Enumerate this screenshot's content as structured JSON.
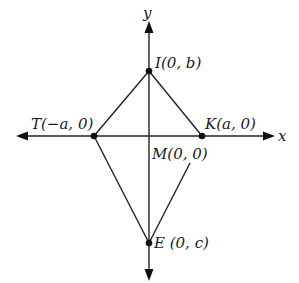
{
  "diagram": {
    "type": "coordinate-geometry",
    "axes": {
      "x_label": "x",
      "y_label": "y"
    },
    "points": [
      {
        "id": "I",
        "name": "I",
        "coords": "(0, b)",
        "label": "I(0, b)",
        "px": [
          149,
          71
        ]
      },
      {
        "id": "T",
        "name": "T",
        "coords": "(−a, 0)",
        "label": "T(−a, 0)",
        "px": [
          94,
          136
        ]
      },
      {
        "id": "K",
        "name": "K",
        "coords": "(a, 0)",
        "label": "K(a, 0)",
        "px": [
          202,
          136
        ]
      },
      {
        "id": "M",
        "name": "M",
        "coords": "(0, 0)",
        "label": "M(0, 0)",
        "px": [
          149,
          136
        ]
      },
      {
        "id": "E",
        "name": "E",
        "coords": "(0, c)",
        "label": "E (0, c)",
        "px": [
          149,
          243
        ]
      }
    ],
    "segments": [
      {
        "from": "T",
        "to": "I"
      },
      {
        "from": "I",
        "to": "K"
      },
      {
        "from": "T",
        "to": "E"
      },
      {
        "from": "E",
        "to": "K",
        "partial": true
      }
    ],
    "colors": {
      "line": "#222222",
      "background": "#ffffff"
    }
  }
}
